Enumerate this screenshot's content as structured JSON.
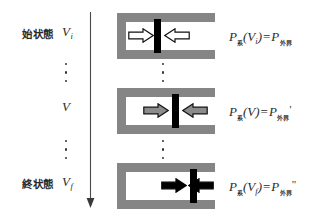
{
  "figure": {
    "title_present": false,
    "colors": {
      "cylinder_wall": "#858585",
      "piston": "#000000",
      "chamber": "#ffffff",
      "arrow_outline": "#ffffff",
      "arrow_mid": "#8c8c8c",
      "arrow_final": "#000000",
      "text": "#2b2b2b",
      "background": "#ffffff"
    },
    "process_arrow": {
      "name": "downward-process-arrow",
      "direction": "down"
    },
    "ellipsis_glyph": "⋮"
  },
  "rows": [
    {
      "state_label": "始状態",
      "volume_symbol": "V",
      "volume_subscript": "i",
      "piston_position_pct": 34,
      "arrow_style": "outline",
      "equation": {
        "p_system_symbol": "P",
        "p_system_subscript": "系",
        "argument_open": "(",
        "argument_symbol": "V",
        "argument_subscript": "i",
        "argument_close": ")",
        "equals": "=",
        "p_surroundings_symbol": "P",
        "p_surroundings_subscript": "外界",
        "prime": ""
      }
    },
    {
      "state_label": "",
      "volume_symbol": "V",
      "volume_subscript": "",
      "piston_position_pct": 56,
      "arrow_style": "gray",
      "equation": {
        "p_system_symbol": "P",
        "p_system_subscript": "系",
        "argument_open": "(",
        "argument_symbol": "V",
        "argument_subscript": "",
        "argument_close": ")",
        "equals": "=",
        "p_surroundings_symbol": "P",
        "p_surroundings_subscript": "外界",
        "prime": "'"
      }
    },
    {
      "state_label": "終状態",
      "volume_symbol": "V",
      "volume_subscript": "f",
      "piston_position_pct": 78,
      "arrow_style": "black",
      "equation": {
        "p_system_symbol": "P",
        "p_system_subscript": "系",
        "argument_open": "(",
        "argument_symbol": "V",
        "argument_subscript": "f",
        "argument_close": ")",
        "equals": "=",
        "p_surroundings_symbol": "P",
        "p_surroundings_subscript": "外界",
        "prime": "\""
      }
    }
  ]
}
